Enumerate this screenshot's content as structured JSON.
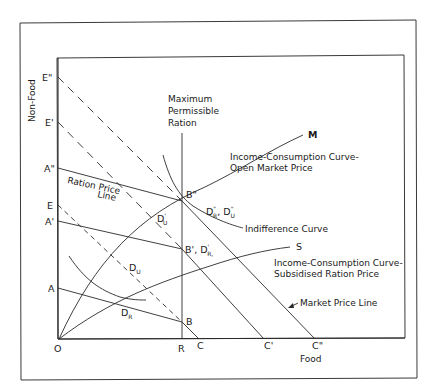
{
  "figure": {
    "axes": {
      "y_label": "Non-Food",
      "x_label": "Food",
      "origin": "O"
    },
    "y_intercepts": [
      "E\"",
      "E'",
      "A\"",
      "E",
      "A'",
      "A"
    ],
    "x_intercepts": [
      "R",
      "C",
      "C'",
      "C\""
    ],
    "vertical_line_label": [
      "Maximum",
      "Permissible",
      "Ration"
    ],
    "ration_price_line_label": [
      "Ration Price",
      "Line"
    ],
    "points": {
      "B2": "B\"",
      "B1": "B', D",
      "B1_sub": "R,",
      "B1_sup": "'",
      "B": "B",
      "DU": "D",
      "DU_sub": "U",
      "DR": "D",
      "DR_sub": "R",
      "DU1": "D",
      "DU1_sub": "U",
      "DU1_sup": "'",
      "D2": "D",
      "D2_sub": "R",
      "D2_sup": "\"",
      "D2b": ", D",
      "D2b_sub": "U",
      "D2b_sup": "\""
    },
    "curve_labels": {
      "icc_open": [
        "Income-Consumption Curve-",
        "Open Market Price"
      ],
      "icc_open_end": "M",
      "indifference": "Indifference Curve",
      "icc_subsidised": [
        "Income-Consumption Curve-",
        "Subsidised Ration Price"
      ],
      "icc_subsidised_end": "S",
      "market_price_line": "Market Price Line"
    }
  }
}
